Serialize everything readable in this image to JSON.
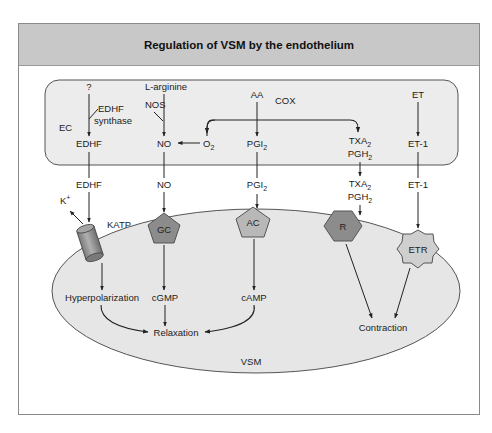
{
  "title": "Regulation of VSM by the endothelium",
  "colors": {
    "header_bg": "#c8c8c8",
    "ec_fill": "#ececec",
    "vsm_fill": "#e6e6e6",
    "receptor_dark": "#8c8c8c",
    "receptor_light": "#cfcfcf",
    "line": "#222222"
  },
  "compartments": {
    "endothelial_cell": "EC",
    "smooth_muscle": "VSM"
  },
  "ec": {
    "unknown": "?",
    "edhf_synthase_1": "EDHF",
    "edhf_synthase_2": "synthase",
    "edhf": "EDHF",
    "l_arginine": "L-arginine",
    "nos": "NOS",
    "no": "NO",
    "o2": "O",
    "o2_sub": "2",
    "aa": "AA",
    "cox": "COX",
    "pgi": "PGI",
    "pgi_sub": "2",
    "txa": "TXA",
    "txa_sub": "2",
    "pgh": "PGH",
    "pgh_sub": "2",
    "et": "ET",
    "et1": "ET-1"
  },
  "mediators": {
    "edhf": "EDHF",
    "no": "NO",
    "pgi": "PGI",
    "pgi_sub": "2",
    "txa": "TXA",
    "txa_sub": "2",
    "pgh": "PGH",
    "pgh_sub": "2",
    "et1": "ET-1",
    "k_ion": "K",
    "k_charge": "+"
  },
  "receptors": {
    "katp": "KATP",
    "gc": "GC",
    "ac": "AC",
    "r": "R",
    "etr": "ETR"
  },
  "vsm": {
    "hyperpolarization": "Hyperpolarization",
    "cgmp": "cGMP",
    "camp": "cAMP",
    "relaxation": "Relaxation",
    "contraction": "Contraction"
  }
}
